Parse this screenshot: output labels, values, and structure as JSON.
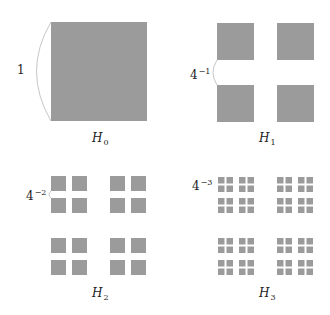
{
  "figure": {
    "square_color": "#9b9b9b",
    "arc_color": "#b8b8b8",
    "panels": [
      {
        "id": "H0",
        "label_base": "H",
        "label_sub": "0",
        "size_label_base": "1",
        "size_label_exp": "",
        "level": 0
      },
      {
        "id": "H1",
        "label_base": "H",
        "label_sub": "1",
        "size_label_base": "4",
        "size_label_exp": "−1",
        "level": 1
      },
      {
        "id": "H2",
        "label_base": "H",
        "label_sub": "2",
        "size_label_base": "4",
        "size_label_exp": "−2",
        "level": 2
      },
      {
        "id": "H3",
        "label_base": "H",
        "label_sub": "3",
        "size_label_base": "4",
        "size_label_exp": "−3",
        "level": 3
      }
    ]
  }
}
